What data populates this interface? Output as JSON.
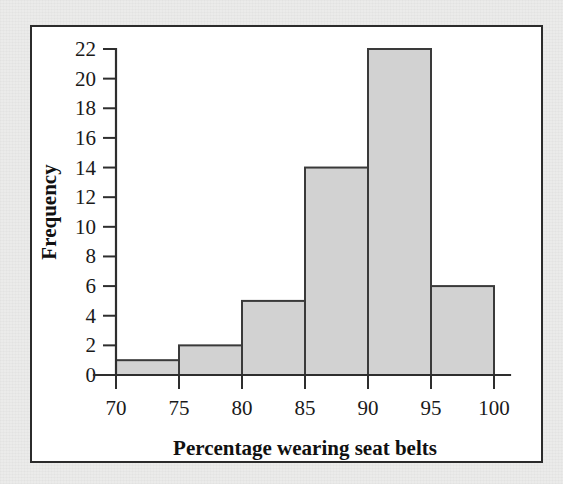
{
  "figure": {
    "background_color": "#ebebea",
    "panel_color": "#ffffff",
    "frame_color": "#2b2b2b"
  },
  "chart_data": {
    "type": "bar",
    "title": "",
    "subtitle": "",
    "xlabel": "Percentage wearing seat belts",
    "ylabel": "Frequency",
    "bin_edges": [
      70,
      75,
      80,
      85,
      90,
      95,
      100
    ],
    "categories": [
      "70-75",
      "75-80",
      "80-85",
      "85-90",
      "90-95",
      "95-100"
    ],
    "values": [
      1,
      2,
      5,
      14,
      22,
      6
    ],
    "xlim": [
      70,
      100
    ],
    "ylim": [
      0,
      22
    ],
    "xticks": [
      70,
      75,
      80,
      85,
      90,
      95,
      100
    ],
    "xtick_labels": [
      "70",
      "75",
      "80",
      "85",
      "90",
      "95",
      "100"
    ],
    "yticks": [
      0,
      2,
      4,
      6,
      8,
      10,
      12,
      14,
      16,
      18,
      20,
      22
    ],
    "ytick_labels": [
      "0",
      "2",
      "4",
      "6",
      "8",
      "10",
      "12",
      "14",
      "16",
      "18",
      "20",
      "22"
    ],
    "grid": false,
    "legend": null,
    "bar_fill_color": "#d2d2d2",
    "bar_edge_color": "#3a3a3a",
    "axis_color": "#2e2e2e"
  }
}
